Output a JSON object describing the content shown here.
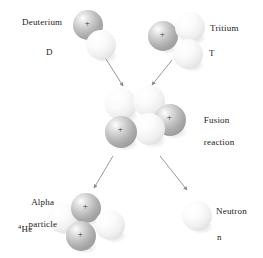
{
  "diagram": {
    "colors": {
      "proton": "#b9b9b9",
      "neutron": "#f2f2f2",
      "arrow": "#8c8c8c",
      "text": "#1a1a1a",
      "background": "#ffffff"
    },
    "labels": {
      "deuterium": "Deuterium",
      "deuterium_symbol": "D",
      "tritium": "Tritium",
      "tritium_symbol": "T",
      "fusion_line1": "Fusion",
      "fusion_line2": "reaction",
      "alpha_line1": "Alpha",
      "alpha_line2": "particle",
      "alpha_symbol_sup": "4",
      "alpha_symbol": "He",
      "neutron": "Neutron",
      "neutron_symbol": "n",
      "plus_sign": "+"
    },
    "particles": {
      "deuterium": [
        {
          "name": "proton",
          "charge": "+",
          "cx": 88,
          "cy": 25,
          "r": 15
        },
        {
          "name": "neutron",
          "charge": "",
          "cx": 101,
          "cy": 45,
          "r": 15
        }
      ],
      "tritium": [
        {
          "name": "proton",
          "charge": "+",
          "cx": 163,
          "cy": 36,
          "r": 15
        },
        {
          "name": "neutron",
          "charge": "",
          "cx": 190,
          "cy": 27,
          "r": 15
        },
        {
          "name": "neutron",
          "charge": "",
          "cx": 188,
          "cy": 54,
          "r": 15
        }
      ],
      "fusion": [
        {
          "name": "neutron",
          "charge": "",
          "cx": 121,
          "cy": 104,
          "r": 16
        },
        {
          "name": "neutron",
          "charge": "",
          "cx": 149,
          "cy": 101,
          "r": 16
        },
        {
          "name": "proton",
          "charge": "+",
          "cx": 170,
          "cy": 120,
          "r": 16
        },
        {
          "name": "neutron",
          "charge": "",
          "cx": 149,
          "cy": 129,
          "r": 16
        },
        {
          "name": "proton",
          "charge": "+",
          "cx": 121,
          "cy": 132,
          "r": 16
        }
      ],
      "alpha": [
        {
          "name": "neutron",
          "charge": "",
          "cx": 63,
          "cy": 218,
          "r": 15
        },
        {
          "name": "proton",
          "charge": "+",
          "cx": 86,
          "cy": 208,
          "r": 15
        },
        {
          "name": "neutron",
          "charge": "",
          "cx": 110,
          "cy": 225,
          "r": 15
        },
        {
          "name": "proton",
          "charge": "+",
          "cx": 81,
          "cy": 236,
          "r": 15
        }
      ],
      "neutron": [
        {
          "name": "neutron",
          "charge": "",
          "cx": 197,
          "cy": 216,
          "r": 15
        }
      ]
    },
    "arrows": [
      {
        "name": "deuterium-to-fusion",
        "x1": 106,
        "y1": 59,
        "x2": 123,
        "y2": 86
      },
      {
        "name": "tritium-to-fusion",
        "x1": 172,
        "y1": 60,
        "x2": 152,
        "y2": 85
      },
      {
        "name": "fusion-to-alpha",
        "x1": 113,
        "y1": 156,
        "x2": 94,
        "y2": 188
      },
      {
        "name": "fusion-to-neutron",
        "x1": 160,
        "y1": 156,
        "x2": 187,
        "y2": 190
      }
    ]
  }
}
